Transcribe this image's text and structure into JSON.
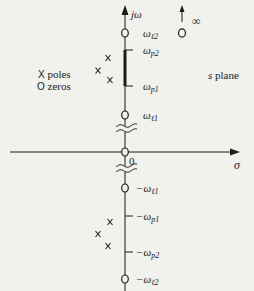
{
  "diagram": {
    "title": "s plane",
    "axes": {
      "vertical_label": "jω",
      "horizontal_label": "σ",
      "origin_label": "0"
    },
    "legend": {
      "poles": {
        "symbol": "X",
        "label": "poles"
      },
      "zeros": {
        "symbol": "O",
        "label": "zeros"
      }
    },
    "infinity": {
      "symbol": "O",
      "label": "∞"
    },
    "frequency_labels": {
      "wl2": {
        "base": "ω",
        "sub": "ℓ2"
      },
      "wp2": {
        "base": "ω",
        "sub": "p2"
      },
      "wp1": {
        "base": "ω",
        "sub": "p1"
      },
      "wl1": {
        "base": "ω",
        "sub": "ℓ1"
      },
      "neg_wl1": {
        "base": "−ω",
        "sub": "ℓ1"
      },
      "neg_wp1": {
        "base": "−ω",
        "sub": "p1"
      },
      "neg_wp2": {
        "base": "−ω",
        "sub": "p2"
      },
      "neg_wl2": {
        "base": "−ω",
        "sub": "ℓ2"
      }
    },
    "poles_upper": 3,
    "poles_lower": 3,
    "zeros_on_axis": [
      "ωℓ2",
      "ωℓ1",
      "0",
      "−ωℓ1",
      "−ωℓ2"
    ],
    "passband": "ωp1 to ωp2 (bold segment)",
    "colors": {
      "ink": "#1b1b1b",
      "paper": "#f1f1ee"
    }
  }
}
